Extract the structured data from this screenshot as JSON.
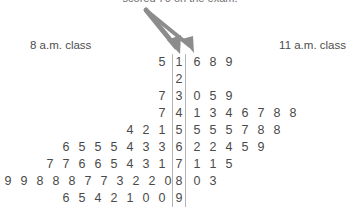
{
  "caption": {
    "text": "scored 70 on the exam."
  },
  "headers": {
    "left_class": "8 a.m. class",
    "right_class": "11 a.m. class"
  },
  "icons": {
    "arrow_1": "arrow-down-right-icon",
    "arrow_2": "arrow-down-right-icon"
  },
  "colors": {
    "text": "#4a4a4a",
    "rule": "#b4b4b4",
    "arrow": "#8c8c8c",
    "background": "#ffffff"
  },
  "chart_data": {
    "type": "table",
    "subtitle": "scored 70 on the exam.",
    "xlabel": "",
    "ylabel": "",
    "legend": [
      "8 a.m. class",
      "11 a.m. class"
    ],
    "stem_label": "stem (tens digit)",
    "leaf_label": "leaf (ones digit)",
    "stems": [
      1,
      2,
      3,
      4,
      5,
      6,
      7,
      8,
      9
    ],
    "rows": [
      {
        "stem": "1",
        "left": "5",
        "right": "6 8 9"
      },
      {
        "stem": "2",
        "left": "",
        "right": ""
      },
      {
        "stem": "3",
        "left": "7",
        "right": "0 5 9"
      },
      {
        "stem": "4",
        "left": "7",
        "right": "1 3 4 6 7 8 8"
      },
      {
        "stem": "5",
        "left": "4 2 1",
        "right": "5 5 5 7 8 8"
      },
      {
        "stem": "6",
        "left": "6 5 5 5 4 3 3",
        "right": "2 2 4 5 9"
      },
      {
        "stem": "7",
        "left": "7 7 6 6 5 4 3 1",
        "right": "1 1 5"
      },
      {
        "stem": "8",
        "left": "9 9 8 8 8 7 7 3 2 2 0",
        "right": "0 3"
      },
      {
        "stem": "9",
        "left": "6 5 4 2 1 0 0",
        "right": ""
      }
    ],
    "series": [
      {
        "name": "8 a.m. class",
        "values": [
          15,
          37,
          47,
          51,
          52,
          54,
          63,
          63,
          64,
          65,
          65,
          65,
          66,
          71,
          73,
          74,
          75,
          76,
          76,
          77,
          77,
          80,
          82,
          82,
          83,
          87,
          87,
          88,
          88,
          88,
          89,
          89,
          90,
          90,
          91,
          92,
          94,
          95,
          96
        ]
      },
      {
        "name": "11 a.m. class",
        "values": [
          16,
          18,
          19,
          30,
          35,
          39,
          41,
          43,
          44,
          46,
          47,
          48,
          48,
          55,
          55,
          55,
          57,
          58,
          58,
          62,
          62,
          64,
          65,
          69,
          71,
          71,
          75,
          80,
          83
        ]
      }
    ]
  }
}
